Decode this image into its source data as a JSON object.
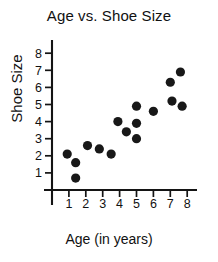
{
  "chart_data": {
    "type": "scatter",
    "title": "Age vs. Shoe Size",
    "xlabel": "Age (in years)",
    "ylabel": "Shoe Size",
    "xlim": [
      0,
      8.6
    ],
    "ylim": [
      0,
      8.6
    ],
    "xticks": [
      1,
      2,
      3,
      4,
      5,
      6,
      7,
      8
    ],
    "yticks": [
      1,
      2,
      3,
      4,
      5,
      6,
      7,
      8
    ],
    "xtick_labels": [
      "1",
      "2",
      "3",
      "4",
      "5",
      "6",
      "7",
      "8"
    ],
    "ytick_labels": [
      "1",
      "2",
      "3",
      "4",
      "5",
      "6",
      "7",
      "8"
    ],
    "grid": false,
    "legend": false,
    "marker": "filled-circle",
    "marker_color": "#181818",
    "marker_size": 4.6,
    "points": [
      {
        "x": 0.9,
        "y": 2.1
      },
      {
        "x": 1.4,
        "y": 1.6
      },
      {
        "x": 1.4,
        "y": 0.7
      },
      {
        "x": 2.1,
        "y": 2.6
      },
      {
        "x": 2.8,
        "y": 2.4
      },
      {
        "x": 3.5,
        "y": 2.1
      },
      {
        "x": 3.9,
        "y": 4.0
      },
      {
        "x": 4.4,
        "y": 3.4
      },
      {
        "x": 5.0,
        "y": 3.9
      },
      {
        "x": 5.0,
        "y": 3.0
      },
      {
        "x": 5.0,
        "y": 4.9
      },
      {
        "x": 6.0,
        "y": 4.6
      },
      {
        "x": 7.0,
        "y": 6.3
      },
      {
        "x": 7.1,
        "y": 5.2
      },
      {
        "x": 7.6,
        "y": 6.9
      },
      {
        "x": 7.7,
        "y": 4.9
      }
    ]
  },
  "axes_geometry": {
    "origin_px": {
      "x": 52,
      "y": 190
    },
    "x_unit_px": 16.9,
    "y_unit_px": 17.1,
    "x_axis_start_px": 44,
    "x_axis_end_px": 197,
    "y_axis_top_px": 40,
    "y_axis_bottom_px": 205,
    "y_tick_len_px": 7,
    "x_tick_len_px": 7
  }
}
